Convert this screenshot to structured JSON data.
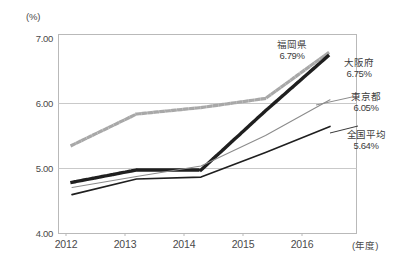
{
  "chart_data": {
    "type": "line",
    "title": "",
    "xlabel": "年度",
    "ylabel": "(%)",
    "y_unit": "(%)",
    "x_unit": "(年度)",
    "categories": [
      "2012",
      "2013",
      "2014",
      "2015",
      "2016"
    ],
    "ylim": [
      4.0,
      7.0
    ],
    "ytick_labels": [
      "4.00",
      "5.00",
      "6.00",
      "7.00"
    ],
    "yticks": [
      4.0,
      5.0,
      6.0,
      7.0
    ],
    "grid": true,
    "legend_position": "inline-right-of-line-end",
    "series": [
      {
        "name": "福岡県",
        "end_value_label": "6.79%",
        "end_value": 6.79,
        "style": "dotted",
        "color": "#a8a8a8",
        "values": [
          5.35,
          5.83,
          5.93,
          6.07,
          6.79
        ]
      },
      {
        "name": "大阪府",
        "end_value_label": "6.75%",
        "end_value": 6.75,
        "style": "dotted",
        "color": "#1f1f1f",
        "values": [
          4.78,
          4.97,
          4.97,
          5.88,
          6.75
        ]
      },
      {
        "name": "東京都",
        "end_value_label": "6.05%",
        "end_value": 6.05,
        "style": "solid-thin",
        "color": "#8c8c8c",
        "values": [
          4.7,
          4.87,
          5.03,
          5.5,
          6.05
        ]
      },
      {
        "name": "全国平均",
        "end_value_label": "5.64%",
        "end_value": 5.64,
        "style": "solid",
        "color": "#1f1f1f",
        "values": [
          4.59,
          4.83,
          4.86,
          5.24,
          5.64
        ]
      }
    ]
  },
  "axes": {
    "y_unit_label": "(%)",
    "x_unit_label": "(年度)",
    "yticks": [
      {
        "label": "7.00"
      },
      {
        "label": "6.00"
      },
      {
        "label": "5.00"
      },
      {
        "label": "4.00"
      }
    ],
    "xticks": [
      {
        "label": "2012"
      },
      {
        "label": "2013"
      },
      {
        "label": "2014"
      },
      {
        "label": "2015"
      },
      {
        "label": "2016"
      }
    ]
  },
  "labels": {
    "fukuoka": {
      "name": "福岡県",
      "value": "6.79%"
    },
    "osaka": {
      "name": "大阪府",
      "value": "6.75%"
    },
    "tokyo": {
      "name": "東京都",
      "value": "6.05%"
    },
    "national": {
      "name": "全国平均",
      "value": "5.64%"
    }
  },
  "colors": {
    "fukuoka": "#a8a8a8",
    "osaka": "#1f1f1f",
    "tokyo": "#8c8c8c",
    "national": "#1f1f1f",
    "grid": "#c9c9c9",
    "axis": "#b5b5b5",
    "text": "#3d3d3d",
    "background": "#ffffff"
  }
}
